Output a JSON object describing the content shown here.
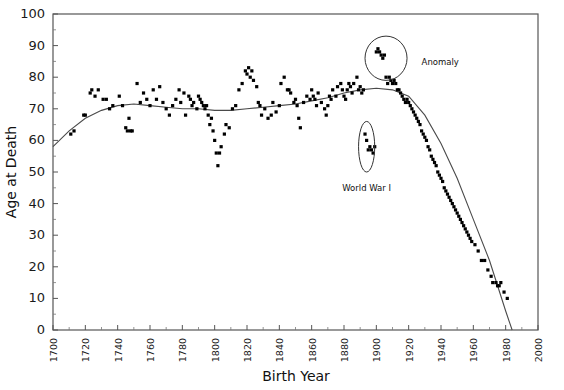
{
  "chart_data": {
    "type": "scatter",
    "title": "",
    "xlabel": "Birth Year",
    "ylabel": "Age at Death",
    "xlim": [
      1700,
      2000
    ],
    "ylim": [
      0,
      100
    ],
    "xticks": [
      1700,
      1720,
      1740,
      1760,
      1780,
      1800,
      1820,
      1840,
      1860,
      1880,
      1900,
      1920,
      1940,
      1960,
      1980,
      2000
    ],
    "yticks": [
      0,
      10,
      20,
      30,
      40,
      50,
      60,
      70,
      80,
      90,
      100
    ],
    "grid": false,
    "legend": "none",
    "marker_color": "#000000",
    "trend_color": "#4a4a4a",
    "frame_color": "#555555",
    "points": [
      [
        1711,
        62
      ],
      [
        1713,
        63
      ],
      [
        1719,
        68
      ],
      [
        1720,
        68
      ],
      [
        1723,
        75
      ],
      [
        1724,
        76
      ],
      [
        1726,
        74
      ],
      [
        1728,
        76
      ],
      [
        1731,
        73
      ],
      [
        1733,
        73
      ],
      [
        1735,
        70
      ],
      [
        1737,
        71
      ],
      [
        1741,
        74
      ],
      [
        1743,
        71
      ],
      [
        1745,
        64
      ],
      [
        1746,
        63
      ],
      [
        1747,
        67
      ],
      [
        1748,
        63
      ],
      [
        1749,
        63
      ],
      [
        1752,
        78
      ],
      [
        1754,
        72
      ],
      [
        1756,
        75
      ],
      [
        1758,
        73
      ],
      [
        1760,
        71
      ],
      [
        1762,
        76
      ],
      [
        1764,
        73
      ],
      [
        1766,
        77
      ],
      [
        1768,
        72
      ],
      [
        1770,
        70
      ],
      [
        1772,
        68
      ],
      [
        1774,
        71
      ],
      [
        1776,
        73
      ],
      [
        1778,
        76
      ],
      [
        1779,
        72
      ],
      [
        1781,
        75
      ],
      [
        1782,
        68
      ],
      [
        1784,
        74
      ],
      [
        1785,
        73
      ],
      [
        1786,
        71
      ],
      [
        1787,
        72
      ],
      [
        1789,
        70
      ],
      [
        1790,
        74
      ],
      [
        1791,
        73
      ],
      [
        1792,
        72
      ],
      [
        1793,
        71
      ],
      [
        1794,
        70
      ],
      [
        1795,
        71
      ],
      [
        1796,
        68
      ],
      [
        1797,
        65
      ],
      [
        1798,
        67
      ],
      [
        1799,
        63
      ],
      [
        1800,
        60
      ],
      [
        1801,
        56
      ],
      [
        1802,
        52
      ],
      [
        1803,
        56
      ],
      [
        1804,
        58
      ],
      [
        1806,
        62
      ],
      [
        1807,
        65
      ],
      [
        1809,
        64
      ],
      [
        1811,
        70
      ],
      [
        1813,
        71
      ],
      [
        1815,
        76
      ],
      [
        1817,
        78
      ],
      [
        1819,
        82
      ],
      [
        1820,
        81
      ],
      [
        1821,
        83
      ],
      [
        1822,
        80
      ],
      [
        1823,
        82
      ],
      [
        1824,
        79
      ],
      [
        1826,
        77
      ],
      [
        1827,
        72
      ],
      [
        1828,
        71
      ],
      [
        1829,
        68
      ],
      [
        1831,
        70
      ],
      [
        1833,
        67
      ],
      [
        1835,
        68
      ],
      [
        1836,
        72
      ],
      [
        1838,
        69
      ],
      [
        1840,
        71
      ],
      [
        1841,
        78
      ],
      [
        1843,
        80
      ],
      [
        1845,
        76
      ],
      [
        1846,
        76
      ],
      [
        1847,
        75
      ],
      [
        1849,
        72
      ],
      [
        1850,
        73
      ],
      [
        1851,
        71
      ],
      [
        1852,
        67
      ],
      [
        1853,
        64
      ],
      [
        1855,
        72
      ],
      [
        1857,
        74
      ],
      [
        1859,
        73
      ],
      [
        1860,
        76
      ],
      [
        1861,
        74
      ],
      [
        1862,
        73
      ],
      [
        1863,
        71
      ],
      [
        1864,
        75
      ],
      [
        1866,
        72
      ],
      [
        1868,
        70
      ],
      [
        1869,
        68
      ],
      [
        1870,
        71
      ],
      [
        1871,
        74
      ],
      [
        1872,
        73
      ],
      [
        1873,
        76
      ],
      [
        1875,
        74
      ],
      [
        1876,
        77
      ],
      [
        1878,
        78
      ],
      [
        1879,
        76
      ],
      [
        1880,
        74
      ],
      [
        1881,
        73
      ],
      [
        1882,
        76
      ],
      [
        1883,
        78
      ],
      [
        1884,
        77
      ],
      [
        1885,
        75
      ],
      [
        1886,
        78
      ],
      [
        1888,
        80
      ],
      [
        1889,
        76
      ],
      [
        1890,
        77
      ],
      [
        1891,
        75
      ],
      [
        1892,
        76
      ],
      [
        1893,
        62
      ],
      [
        1894,
        60
      ],
      [
        1895,
        57
      ],
      [
        1896,
        58
      ],
      [
        1897,
        57
      ],
      [
        1898,
        56
      ],
      [
        1899,
        58
      ],
      [
        1900,
        88
      ],
      [
        1901,
        89
      ],
      [
        1902,
        88
      ],
      [
        1903,
        87
      ],
      [
        1904,
        86
      ],
      [
        1905,
        87
      ],
      [
        1906,
        80
      ],
      [
        1907,
        78
      ],
      [
        1908,
        80
      ],
      [
        1909,
        79
      ],
      [
        1910,
        78
      ],
      [
        1911,
        79
      ],
      [
        1912,
        78
      ],
      [
        1913,
        76
      ],
      [
        1914,
        76
      ],
      [
        1915,
        75
      ],
      [
        1916,
        74
      ],
      [
        1917,
        73
      ],
      [
        1918,
        72
      ],
      [
        1919,
        73
      ],
      [
        1920,
        72
      ],
      [
        1921,
        71
      ],
      [
        1922,
        70
      ],
      [
        1923,
        69
      ],
      [
        1924,
        68
      ],
      [
        1925,
        67
      ],
      [
        1926,
        66
      ],
      [
        1927,
        65
      ],
      [
        1928,
        63
      ],
      [
        1929,
        62
      ],
      [
        1930,
        61
      ],
      [
        1931,
        60
      ],
      [
        1932,
        58
      ],
      [
        1933,
        57
      ],
      [
        1934,
        55
      ],
      [
        1935,
        54
      ],
      [
        1936,
        53
      ],
      [
        1937,
        52
      ],
      [
        1938,
        50
      ],
      [
        1939,
        49
      ],
      [
        1940,
        48
      ],
      [
        1941,
        47
      ],
      [
        1942,
        45
      ],
      [
        1943,
        44
      ],
      [
        1944,
        43
      ],
      [
        1945,
        42
      ],
      [
        1946,
        41
      ],
      [
        1947,
        40
      ],
      [
        1948,
        39
      ],
      [
        1949,
        38
      ],
      [
        1950,
        37
      ],
      [
        1951,
        36
      ],
      [
        1952,
        35
      ],
      [
        1953,
        34
      ],
      [
        1954,
        33
      ],
      [
        1955,
        32
      ],
      [
        1956,
        31
      ],
      [
        1957,
        30
      ],
      [
        1958,
        29
      ],
      [
        1959,
        28
      ],
      [
        1961,
        27
      ],
      [
        1963,
        25
      ],
      [
        1965,
        22
      ],
      [
        1967,
        22
      ],
      [
        1969,
        19
      ],
      [
        1971,
        17
      ],
      [
        1972,
        15
      ],
      [
        1974,
        15
      ],
      [
        1975,
        14
      ],
      [
        1976,
        14
      ],
      [
        1977,
        15
      ],
      [
        1979,
        12
      ],
      [
        1981,
        10
      ]
    ],
    "trend": [
      [
        1700,
        58
      ],
      [
        1710,
        63
      ],
      [
        1720,
        67
      ],
      [
        1730,
        69.5
      ],
      [
        1740,
        71
      ],
      [
        1750,
        71.5
      ],
      [
        1760,
        71
      ],
      [
        1770,
        70.5
      ],
      [
        1780,
        70
      ],
      [
        1790,
        70
      ],
      [
        1800,
        69.5
      ],
      [
        1810,
        69.5
      ],
      [
        1820,
        70
      ],
      [
        1830,
        70.5
      ],
      [
        1840,
        71
      ],
      [
        1850,
        71.5
      ],
      [
        1860,
        72.5
      ],
      [
        1870,
        73.5
      ],
      [
        1880,
        75
      ],
      [
        1890,
        76
      ],
      [
        1900,
        76.5
      ],
      [
        1910,
        76
      ],
      [
        1920,
        74
      ],
      [
        1930,
        68
      ],
      [
        1940,
        59
      ],
      [
        1950,
        48
      ],
      [
        1960,
        35
      ],
      [
        1970,
        22
      ],
      [
        1980,
        6
      ],
      [
        1984,
        0
      ]
    ],
    "annotations": [
      {
        "label": "Anomaly",
        "shape": "circle",
        "center_x": 1906,
        "center_y": 86,
        "rx_years": 13,
        "ry_age": 7,
        "text_x": 1928,
        "text_y": 84
      },
      {
        "label": "World War I",
        "shape": "ellipse",
        "center_x": 1894,
        "center_y": 58,
        "rx_years": 5,
        "ry_age": 8,
        "text_x": 1894,
        "text_y": 44
      }
    ]
  }
}
